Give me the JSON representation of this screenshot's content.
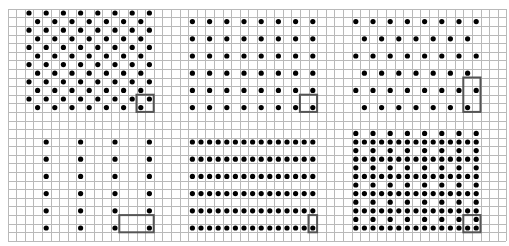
{
  "figure": {
    "width": 509,
    "height": 246,
    "grid": {
      "origin_x": 7.5,
      "origin_y": 8.7,
      "cell": 8.6,
      "cols": 58,
      "rows": 27,
      "line_color": "#b9b9b9"
    },
    "dot_color": "#000000",
    "dot_radius": 2.6,
    "box_color": "#555555",
    "panels": [
      {
        "name": "panel-top-left-staggered",
        "rows": [
          {
            "row": 0,
            "cols_from": 2,
            "cols_to": 16,
            "step": 2
          },
          {
            "row": 1,
            "cols_from": 3,
            "cols_to": 15,
            "step": 2
          },
          {
            "row": 2,
            "cols_from": 2,
            "cols_to": 16,
            "step": 2
          },
          {
            "row": 3,
            "cols_from": 3,
            "cols_to": 15,
            "step": 2
          },
          {
            "row": 4,
            "cols_from": 2,
            "cols_to": 16,
            "step": 2
          },
          {
            "row": 5,
            "cols_from": 3,
            "cols_to": 15,
            "step": 2
          },
          {
            "row": 6,
            "cols_from": 2,
            "cols_to": 16,
            "step": 2
          },
          {
            "row": 7,
            "cols_from": 3,
            "cols_to": 15,
            "step": 2
          },
          {
            "row": 8,
            "cols_from": 2,
            "cols_to": 16,
            "step": 2
          },
          {
            "row": 9,
            "cols_from": 3,
            "cols_to": 15,
            "step": 2
          },
          {
            "row": 10,
            "cols_from": 2,
            "cols_to": 16,
            "step": 2
          },
          {
            "row": 11,
            "cols_from": 3,
            "cols_to": 15,
            "step": 2
          }
        ],
        "box": {
          "col": 15,
          "row": 10,
          "w": 2,
          "h": 2
        }
      },
      {
        "name": "panel-top-middle-square",
        "rows": [
          {
            "row": 1,
            "cols_from": 21,
            "cols_to": 35,
            "step": 2
          },
          {
            "row": 3,
            "cols_from": 21,
            "cols_to": 35,
            "step": 2
          },
          {
            "row": 5,
            "cols_from": 21,
            "cols_to": 35,
            "step": 2
          },
          {
            "row": 7,
            "cols_from": 21,
            "cols_to": 35,
            "step": 2
          },
          {
            "row": 9,
            "cols_from": 21,
            "cols_to": 35,
            "step": 2
          },
          {
            "row": 11,
            "cols_from": 21,
            "cols_to": 35,
            "step": 2
          }
        ],
        "box": {
          "col": 34,
          "row": 10,
          "w": 2,
          "h": 2
        }
      },
      {
        "name": "panel-top-right-staggered-sparse",
        "rows": [
          {
            "row": 1,
            "cols_from": 40,
            "cols_to": 54,
            "step": 2
          },
          {
            "row": 3,
            "cols_from": 41,
            "cols_to": 53,
            "step": 2
          },
          {
            "row": 5,
            "cols_from": 40,
            "cols_to": 54,
            "step": 2
          },
          {
            "row": 7,
            "cols_from": 41,
            "cols_to": 53,
            "step": 2
          },
          {
            "row": 9,
            "cols_from": 40,
            "cols_to": 54,
            "step": 2
          },
          {
            "row": 11,
            "cols_from": 41,
            "cols_to": 53,
            "step": 2
          }
        ],
        "box": {
          "col": 53,
          "row": 8,
          "w": 2,
          "h": 4
        }
      },
      {
        "name": "panel-bottom-left-wide-rect",
        "rows": [
          {
            "row": 15,
            "cols_from": 4,
            "cols_to": 16,
            "step": 4
          },
          {
            "row": 17,
            "cols_from": 4,
            "cols_to": 16,
            "step": 4
          },
          {
            "row": 19,
            "cols_from": 4,
            "cols_to": 16,
            "step": 4
          },
          {
            "row": 21,
            "cols_from": 4,
            "cols_to": 16,
            "step": 4
          },
          {
            "row": 23,
            "cols_from": 4,
            "cols_to": 16,
            "step": 4
          },
          {
            "row": 25,
            "cols_from": 4,
            "cols_to": 16,
            "step": 4
          }
        ],
        "box": {
          "col": 13,
          "row": 24,
          "w": 4,
          "h": 2
        }
      },
      {
        "name": "panel-bottom-middle-tall-rect",
        "rows": [
          {
            "row": 15,
            "cols_from": 21,
            "cols_to": 35,
            "step": 1
          },
          {
            "row": 17,
            "cols_from": 21,
            "cols_to": 35,
            "step": 1
          },
          {
            "row": 19,
            "cols_from": 21,
            "cols_to": 35,
            "step": 1
          },
          {
            "row": 21,
            "cols_from": 21,
            "cols_to": 35,
            "step": 1
          },
          {
            "row": 23,
            "cols_from": 21,
            "cols_to": 35,
            "step": 1
          },
          {
            "row": 25,
            "cols_from": 21,
            "cols_to": 35,
            "step": 1
          }
        ],
        "box": {
          "col": 35,
          "row": 24,
          "w": 1,
          "h": 2
        }
      },
      {
        "name": "panel-bottom-right-centered-rect",
        "rows": [
          {
            "row": 14,
            "cols_from": 40,
            "cols_to": 54,
            "step": 2
          },
          {
            "row": 15,
            "cols_from": 40,
            "cols_to": 54,
            "step": 1
          },
          {
            "row": 16,
            "cols_from": 40,
            "cols_to": 54,
            "step": 2
          },
          {
            "row": 17,
            "cols_from": 40,
            "cols_to": 54,
            "step": 1
          },
          {
            "row": 18,
            "cols_from": 40,
            "cols_to": 54,
            "step": 2
          },
          {
            "row": 19,
            "cols_from": 40,
            "cols_to": 54,
            "step": 1
          },
          {
            "row": 20,
            "cols_from": 40,
            "cols_to": 54,
            "step": 2
          },
          {
            "row": 21,
            "cols_from": 40,
            "cols_to": 54,
            "step": 1
          },
          {
            "row": 22,
            "cols_from": 40,
            "cols_to": 54,
            "step": 2
          },
          {
            "row": 23,
            "cols_from": 40,
            "cols_to": 54,
            "step": 1
          },
          {
            "row": 24,
            "cols_from": 40,
            "cols_to": 54,
            "step": 2
          },
          {
            "row": 25,
            "cols_from": 40,
            "cols_to": 54,
            "step": 1
          }
        ],
        "box": {
          "col": 53,
          "row": 24,
          "w": 2,
          "h": 2
        }
      }
    ]
  }
}
